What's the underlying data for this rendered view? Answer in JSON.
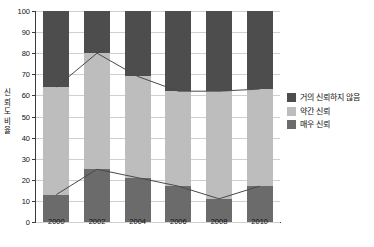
{
  "chart_data": {
    "type": "bar",
    "title": "",
    "xlabel": "",
    "ylabel": "신뢰도 비율",
    "ylabel_chars": [
      "신",
      "뢰",
      "도",
      "비",
      "율"
    ],
    "categories": [
      "2000",
      "2002",
      "2004",
      "2006",
      "2008",
      "2010"
    ],
    "ylim": [
      0,
      100
    ],
    "yticks": [
      0,
      10,
      20,
      30,
      40,
      50,
      60,
      70,
      80,
      90,
      100
    ],
    "ytick_labels": [
      "0",
      "10",
      "20",
      "30",
      "40",
      "50",
      "60",
      "70",
      "80",
      "90",
      "100"
    ],
    "grid": true,
    "stacked": true,
    "stack_total": 100,
    "legend_position": "right",
    "series": [
      {
        "name": "거의 신뢰하지 않음",
        "color": "#4d4d4d",
        "values": [
          36,
          20,
          31,
          38,
          38,
          37
        ]
      },
      {
        "name": "약간 신뢰",
        "color": "#bdbdbd",
        "values": [
          51,
          55,
          48,
          45,
          51,
          46
        ]
      },
      {
        "name": "매우 신뢰",
        "color": "#6b6b6b",
        "values": [
          13,
          25,
          21,
          17,
          11,
          17
        ]
      }
    ],
    "cumulative_boundaries": {
      "very_trust_top": [
        13,
        25,
        21,
        17,
        11,
        17
      ],
      "somewhat_trust_top": [
        64,
        80,
        69,
        62,
        62,
        63
      ]
    },
    "overlay_lines": [
      {
        "name": "매우 신뢰 누적선",
        "values": [
          13,
          25,
          21,
          17,
          11,
          17
        ]
      },
      {
        "name": "약간 신뢰 누적선",
        "values": [
          64,
          80,
          69,
          62,
          62,
          63
        ]
      }
    ]
  },
  "legend": {
    "items": [
      {
        "label": "거의 신뢰하지 않음",
        "color": "#4d4d4d"
      },
      {
        "label": "약간 신뢰",
        "color": "#bdbdbd"
      },
      {
        "label": "매우 신뢰",
        "color": "#6b6b6b"
      }
    ]
  },
  "colors": {
    "axis": "#3a3a3a",
    "grid": "#cfcfcf",
    "line": "#4a4a4a",
    "background": "#ffffff",
    "text": "#111111"
  }
}
